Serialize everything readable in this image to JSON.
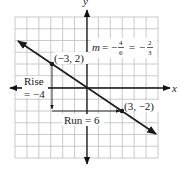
{
  "figure": {
    "type": "coordinate-graph",
    "axes": {
      "x_label": "x",
      "y_label": "y",
      "x_range": [
        -6,
        6
      ],
      "y_range": [
        -6,
        6
      ],
      "grid": true,
      "grid_step": 1
    },
    "line": {
      "slope_label_prefix": "m",
      "slope_text": "m = −4/6 = −2/3",
      "slope_frac1_num": "4",
      "slope_frac1_den": "6",
      "slope_frac2_num": "2",
      "slope_frac2_den": "3",
      "from": [
        -6,
        4
      ],
      "to": [
        6,
        -4
      ]
    },
    "points": [
      {
        "label": "(−3, 2)",
        "x": -3,
        "y": 2
      },
      {
        "label": "(3, −2)",
        "x": 3,
        "y": -2
      }
    ],
    "rise": {
      "label_line1": "Rise",
      "label_line2": "= −4",
      "value": -4
    },
    "run": {
      "label": "Run = 6",
      "value": 6
    },
    "colors": {
      "grid": "#bdbdbd",
      "axis": "#111111",
      "line": "#1a1a1a",
      "text": "#1a1a1a",
      "background": "#ffffff"
    }
  }
}
